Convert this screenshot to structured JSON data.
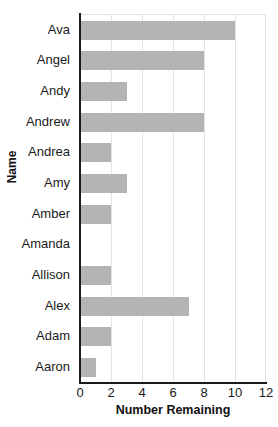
{
  "chart_data": {
    "type": "bar",
    "orientation": "horizontal",
    "title": "",
    "xlabel": "Number Remaining",
    "ylabel": "Name",
    "categories": [
      "Ava",
      "Angel",
      "Andy",
      "Andrew",
      "Andrea",
      "Amy",
      "Amber",
      "Amanda",
      "Allison",
      "Alex",
      "Adam",
      "Aaron"
    ],
    "values": [
      10,
      8,
      3,
      8,
      2,
      3,
      2,
      0,
      2,
      7,
      2,
      1
    ],
    "xlim": [
      0,
      12
    ],
    "xticks": [
      0,
      2,
      4,
      6,
      8,
      10,
      12
    ],
    "xtick_labels": [
      "0",
      "2",
      "4",
      "6",
      "8",
      "10",
      "12"
    ],
    "gridlines": [
      2,
      4,
      6,
      8,
      10
    ],
    "grid": true,
    "legend": false,
    "bar_color": "#b4b4b4",
    "grid_color": "#e4e4e4",
    "axis_color": "#1a1a1a",
    "background": "#ffffff"
  }
}
